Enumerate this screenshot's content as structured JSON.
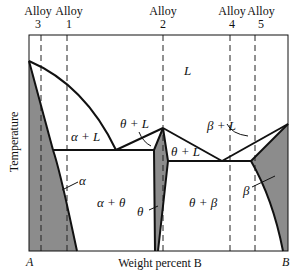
{
  "diagram": {
    "ylabel": "Temperature",
    "xlabel": "Weight percent B",
    "x_left_end": "A",
    "x_right_end": "B",
    "colors": {
      "solid_phase_fill": "#8c8c8c",
      "line": "#111111",
      "background": "#ffffff"
    }
  },
  "alloys": [
    {
      "word": "Alloy",
      "number": "3"
    },
    {
      "word": "Alloy",
      "number": "1"
    },
    {
      "word": "Alloy",
      "number": "2"
    },
    {
      "word": "Alloy",
      "number": "4"
    },
    {
      "word": "Alloy",
      "number": "5"
    }
  ],
  "regions": {
    "liquid": "L",
    "alpha_liquid": "α + L",
    "theta_liquid": "θ + L",
    "theta_liquid_right": "θ + L",
    "beta_liquid": "β + L",
    "alpha": "α",
    "alpha_theta": "α + θ",
    "theta": "θ",
    "theta_beta": "θ + β",
    "beta": "β"
  }
}
